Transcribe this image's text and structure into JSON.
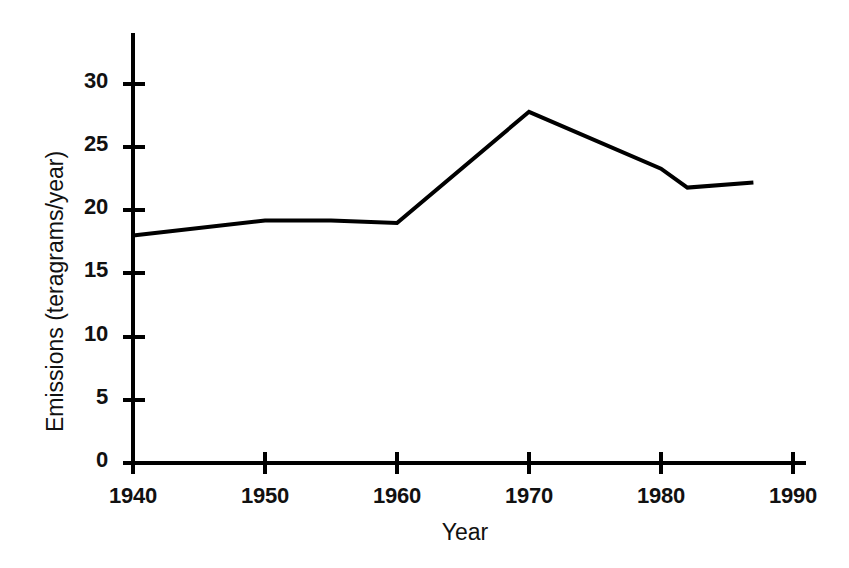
{
  "chart_data": {
    "type": "line",
    "title": "",
    "subtitle": "",
    "xlabel": "Year",
    "ylabel": "Emissions (teragrams/year)",
    "xlim": [
      1940,
      1990
    ],
    "ylim": [
      0,
      33
    ],
    "xticks": [
      1940,
      1950,
      1960,
      1970,
      1980,
      1990
    ],
    "xtick_labels": [
      "1940",
      "1950",
      "1960",
      "1970",
      "1980",
      "1990"
    ],
    "yticks": [
      0,
      5,
      10,
      15,
      20,
      25,
      30
    ],
    "ytick_labels": [
      "0",
      "5",
      "10",
      "15",
      "20",
      "25",
      "30"
    ],
    "grid": false,
    "legend": false,
    "legend_position": "none",
    "line_color": "#000000",
    "line_width": 4,
    "series": [
      {
        "name": "Emissions",
        "x": [
          1940,
          1950,
          1955,
          1960,
          1970,
          1980,
          1982,
          1987
        ],
        "values": [
          18.0,
          19.2,
          19.2,
          19.0,
          27.8,
          23.3,
          21.8,
          22.2
        ]
      }
    ],
    "annotations": []
  },
  "axes": {
    "x_axis_name": "year-axis",
    "y_axis_name": "emissions-axis"
  },
  "artifacts": {
    "scan_speck": ""
  }
}
